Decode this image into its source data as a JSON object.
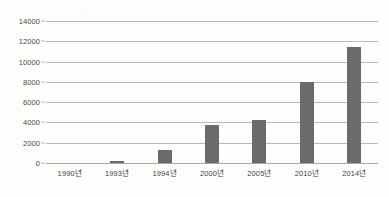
{
  "chart_data": {
    "type": "bar",
    "title": "",
    "xlabel": "",
    "ylabel": "",
    "categories": [
      "1990년",
      "1993년",
      "1994년",
      "2000년",
      "2005년",
      "2010년",
      "2014년"
    ],
    "values": [
      0,
      150,
      1300,
      3750,
      4200,
      8000,
      11400
    ],
    "ylim": [
      0,
      14000
    ],
    "yticks": [
      0,
      2000,
      4000,
      6000,
      8000,
      10000,
      12000,
      14000
    ],
    "ytick_labels": [
      "0",
      "2000",
      "4000",
      "6000",
      "8000",
      "10000",
      "12000",
      "14000"
    ],
    "grid": true,
    "legend": false,
    "series": [
      {
        "name": "",
        "values": [
          0,
          150,
          1300,
          3750,
          4200,
          8000,
          11400
        ]
      }
    ]
  },
  "style": {
    "bar_color": "#6b6b6b",
    "grid_color": "#b9b9b9",
    "axis_color": "#a8a8a8",
    "label_color": "#4b4b4b",
    "background": "#fdfdfc"
  }
}
